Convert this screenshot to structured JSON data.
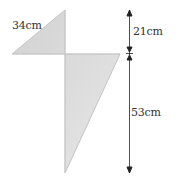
{
  "diagram": {
    "shape": "kite",
    "fill_color": "#dcdcdc",
    "edge_color": "#bdbdbd",
    "arrow_color": "#222222",
    "labels": {
      "side": "34cm",
      "upper_height": "21cm",
      "lower_height": "53cm"
    }
  }
}
